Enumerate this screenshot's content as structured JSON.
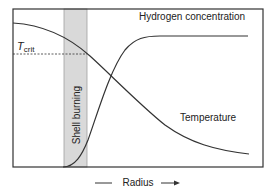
{
  "diagram": {
    "labels": {
      "hydrogen": "Hydrogen concentration",
      "temperature": "Temperature",
      "t_crit_main": "T",
      "t_crit_sub": "crit",
      "shell": "Shell burning",
      "x_axis": "Radius"
    },
    "colors": {
      "line": "#333333",
      "shell_fill": "#d9d9d9",
      "shell_border": "#999999",
      "frame": "#333333"
    },
    "frame": {
      "x": 13,
      "y": 9,
      "width": 250,
      "height": 158
    },
    "shell_band": {
      "x_start": 64,
      "x_end": 87
    },
    "t_crit_y": 54
  }
}
